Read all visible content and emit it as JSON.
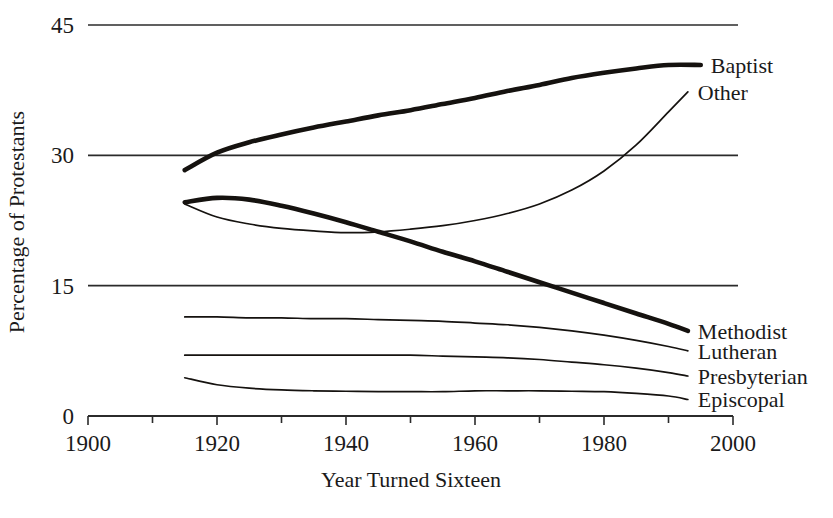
{
  "chart_data": {
    "type": "line",
    "title": "",
    "xlabel": "Year Turned Sixteen",
    "ylabel": "Percentage of Protestants",
    "xlim": [
      1900,
      2000
    ],
    "ylim": [
      0,
      45
    ],
    "grid": true,
    "legend_position": "right-inline",
    "x_ticks_major": [
      1900,
      1920,
      1940,
      1960,
      1980,
      2000
    ],
    "x_ticks_minor": [
      1910,
      1930,
      1950,
      1970,
      1990
    ],
    "y_ticks": [
      0,
      15,
      30,
      45
    ],
    "x_tick_labels": [
      "1900",
      "1920",
      "1940",
      "1960",
      "1980",
      "2000"
    ],
    "y_tick_labels": [
      "0",
      "15",
      "30",
      "45"
    ],
    "series": [
      {
        "name": "Baptist",
        "style": "thick",
        "x": [
          1915,
          1920,
          1925,
          1930,
          1935,
          1940,
          1945,
          1950,
          1955,
          1960,
          1965,
          1970,
          1975,
          1980,
          1985,
          1990,
          1995
        ],
        "values": [
          28.3,
          30.3,
          31.5,
          32.4,
          33.2,
          33.9,
          34.6,
          35.2,
          35.9,
          36.6,
          37.4,
          38.1,
          38.9,
          39.5,
          40.0,
          40.4,
          40.4
        ]
      },
      {
        "name": "Other",
        "style": "thin",
        "x": [
          1915,
          1920,
          1925,
          1930,
          1935,
          1940,
          1945,
          1950,
          1955,
          1960,
          1965,
          1970,
          1975,
          1980,
          1985,
          1990,
          1993
        ],
        "values": [
          24.4,
          22.9,
          22.1,
          21.6,
          21.3,
          21.1,
          21.2,
          21.5,
          21.9,
          22.5,
          23.3,
          24.4,
          26.0,
          28.2,
          31.2,
          35.0,
          37.3
        ]
      },
      {
        "name": "Methodist",
        "style": "thick",
        "x": [
          1915,
          1920,
          1925,
          1930,
          1935,
          1940,
          1945,
          1950,
          1955,
          1960,
          1965,
          1970,
          1975,
          1980,
          1985,
          1990,
          1993
        ],
        "values": [
          24.6,
          25.1,
          24.9,
          24.2,
          23.3,
          22.3,
          21.2,
          20.1,
          18.9,
          17.8,
          16.6,
          15.4,
          14.2,
          13.0,
          11.8,
          10.6,
          9.8
        ]
      },
      {
        "name": "Lutheran",
        "style": "thin",
        "x": [
          1915,
          1920,
          1925,
          1930,
          1935,
          1940,
          1945,
          1950,
          1955,
          1960,
          1965,
          1970,
          1975,
          1980,
          1985,
          1990,
          1993
        ],
        "values": [
          11.4,
          11.4,
          11.3,
          11.3,
          11.2,
          11.2,
          11.1,
          11.0,
          10.9,
          10.7,
          10.5,
          10.2,
          9.8,
          9.3,
          8.7,
          8.0,
          7.5
        ]
      },
      {
        "name": "Presbyterian",
        "style": "thin",
        "x": [
          1915,
          1920,
          1925,
          1930,
          1935,
          1940,
          1945,
          1950,
          1955,
          1960,
          1965,
          1970,
          1975,
          1980,
          1985,
          1990,
          1993
        ],
        "values": [
          7.0,
          7.0,
          7.0,
          7.0,
          7.0,
          7.0,
          7.0,
          7.0,
          6.9,
          6.8,
          6.7,
          6.5,
          6.2,
          5.9,
          5.5,
          5.0,
          4.6
        ]
      },
      {
        "name": "Episcopal",
        "style": "thin",
        "x": [
          1915,
          1920,
          1925,
          1930,
          1935,
          1940,
          1945,
          1950,
          1955,
          1960,
          1965,
          1970,
          1975,
          1980,
          1985,
          1990,
          1993
        ],
        "values": [
          4.4,
          3.6,
          3.2,
          3.0,
          2.9,
          2.85,
          2.8,
          2.8,
          2.8,
          2.9,
          2.9,
          2.9,
          2.85,
          2.8,
          2.6,
          2.3,
          1.9
        ]
      }
    ],
    "annotations": [
      {
        "text": "Baptist",
        "x": 1995,
        "y": 40.4
      },
      {
        "text": "Other",
        "x": 1993,
        "y": 37.3
      },
      {
        "text": "Methodist",
        "x": 1993,
        "y": 9.8
      },
      {
        "text": "Lutheran",
        "x": 1993,
        "y": 7.5
      },
      {
        "text": "Presbyterian",
        "x": 1993,
        "y": 4.6
      },
      {
        "text": "Episcopal",
        "x": 1993,
        "y": 1.9
      }
    ]
  }
}
